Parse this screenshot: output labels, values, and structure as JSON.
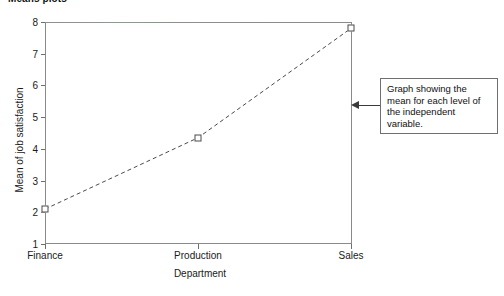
{
  "chart_title": "Means plots",
  "annotation": {
    "text": "Graph showing the mean for each level of the independent variable.",
    "arrow_icon": "arrow-left-icon"
  },
  "chart_data": {
    "type": "line",
    "title": "Means plots",
    "xlabel": "Department",
    "ylabel": "Mean of job satisfaction",
    "categories": [
      "Finance",
      "Production",
      "Sales"
    ],
    "values": [
      2.1,
      4.35,
      7.8
    ],
    "series": [
      {
        "name": "Mean of job satisfaction",
        "values": [
          2.1,
          4.35,
          7.8
        ],
        "line_style": "dashed",
        "marker": "open-square",
        "color": "#4a4a4a"
      }
    ],
    "ylim": [
      1,
      8
    ],
    "yticks": [
      1,
      2,
      3,
      4,
      5,
      6,
      7,
      8
    ],
    "ytick_labels": [
      "1",
      "2",
      "3",
      "4",
      "5",
      "6",
      "7",
      "8"
    ],
    "xticks": [
      "Finance",
      "Production",
      "Sales"
    ],
    "grid": false,
    "legend": "none",
    "annotations": [
      {
        "text": "Graph showing the mean for each level of the independent variable.",
        "points_to": "right-axis-spine"
      }
    ]
  },
  "colors": {
    "axis": "#8a8a8a",
    "series": "#4a4a4a",
    "annotation_border": "#6f6f6f",
    "text": "#1a1a1a"
  }
}
